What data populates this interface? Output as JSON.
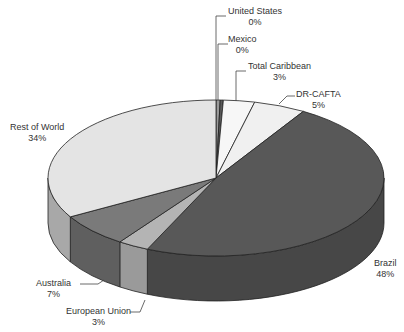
{
  "chart_data": {
    "type": "pie",
    "style": "3d-exploded-none",
    "title": "",
    "categories": [
      "United States",
      "Mexico",
      "Total Caribbean",
      "DR-CAFTA",
      "Brazil",
      "European Union",
      "Australia",
      "Rest of World"
    ],
    "values": [
      0.4,
      0.3,
      3,
      5,
      48,
      3,
      7,
      33.3
    ],
    "labels": [
      "0%",
      "0%",
      "3%",
      "5%",
      "48%",
      "3%",
      "7%",
      "34%"
    ],
    "colors": [
      "#9a9a9a",
      "#5a5a5a",
      "#f7f7f7",
      "#f0f0f0",
      "#585858",
      "#b4b4b4",
      "#7a7a7a",
      "#e4e4e4"
    ],
    "side_colors": [
      "#7a7a7a",
      "#404040",
      "#d0d0d0",
      "#c8c8c8",
      "#474747",
      "#9a9a9a",
      "#5f5f5f",
      "#a8a8a8"
    ],
    "start_angle_deg": 0,
    "direction": "clockwise",
    "legend": "none"
  },
  "labels": [
    {
      "name": "United States",
      "pct": "0%",
      "x": 255,
      "y": 6
    },
    {
      "name": "Mexico",
      "pct": "0%",
      "x": 250,
      "y": 34
    },
    {
      "name": "Total Caribbean",
      "pct": "3%",
      "x": 280,
      "y": 61
    },
    {
      "name": "DR-CAFTA",
      "pct": "5%",
      "x": 317,
      "y": 91
    },
    {
      "name": "Rest of World",
      "pct": "34%",
      "x": 36,
      "y": 122
    },
    {
      "name": "Brazil",
      "pct": "48%",
      "x": 388,
      "y": 264
    },
    {
      "name": "Australia",
      "pct": "7%",
      "x": 64,
      "y": 280
    },
    {
      "name": "European Union",
      "pct": "3%",
      "x": 100,
      "y": 308
    }
  ]
}
